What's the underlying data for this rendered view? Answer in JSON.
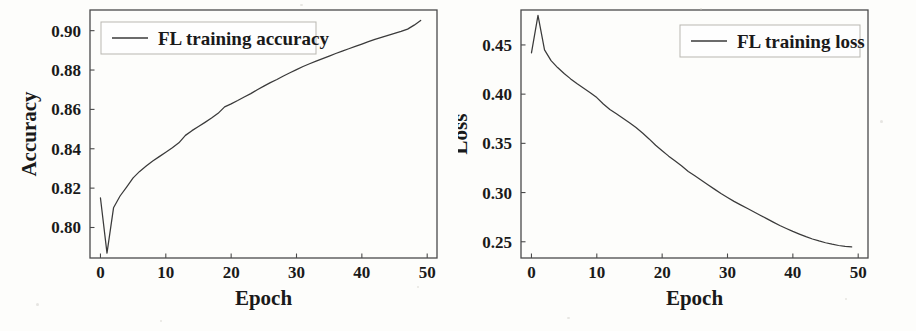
{
  "figure": {
    "background_color": "#fdfdfb",
    "line_color": "#3a3a3a",
    "text_color": "#1a1a1a",
    "axis_color": "#4a4a4a"
  },
  "charts": [
    {
      "id": "accuracy",
      "legend_label": "FL training accuracy",
      "xlabel": "Epoch",
      "ylabel": "Accuracy",
      "xticks": [
        "0",
        "10",
        "20",
        "30",
        "40",
        "50"
      ],
      "yticks": [
        "0.80",
        "0.82",
        "0.84",
        "0.86",
        "0.88",
        "0.90"
      ]
    },
    {
      "id": "loss",
      "legend_label": "FL training loss",
      "xlabel": "Epoch",
      "ylabel": "Loss",
      "xticks": [
        "0",
        "10",
        "20",
        "30",
        "40",
        "50"
      ],
      "yticks": [
        "0.25",
        "0.30",
        "0.35",
        "0.40",
        "0.45"
      ]
    }
  ],
  "chart_data": [
    {
      "type": "line",
      "title": "",
      "xlabel": "Epoch",
      "ylabel": "Accuracy",
      "xlim": [
        -1.6,
        51.5
      ],
      "ylim": [
        0.7845,
        0.9105
      ],
      "xticks": [
        0,
        10,
        20,
        30,
        40,
        50
      ],
      "yticks": [
        0.8,
        0.82,
        0.84,
        0.86,
        0.88,
        0.9
      ],
      "grid": false,
      "legend": [
        "FL training accuracy"
      ],
      "legend_position": "upper left",
      "series": [
        {
          "name": "FL training accuracy",
          "x": [
            0,
            1,
            2,
            3,
            4,
            5,
            6,
            7,
            8,
            9,
            10,
            11,
            12,
            13,
            14,
            15,
            16,
            17,
            18,
            19,
            20,
            21,
            22,
            23,
            24,
            25,
            26,
            27,
            28,
            29,
            30,
            31,
            32,
            33,
            34,
            35,
            36,
            37,
            38,
            39,
            40,
            41,
            42,
            43,
            44,
            45,
            46,
            47,
            48,
            49
          ],
          "values": [
            0.815,
            0.787,
            0.81,
            0.816,
            0.8205,
            0.8252,
            0.8285,
            0.8312,
            0.8338,
            0.836,
            0.8382,
            0.8405,
            0.843,
            0.8468,
            0.8492,
            0.8513,
            0.8534,
            0.8556,
            0.858,
            0.8613,
            0.8628,
            0.8645,
            0.8663,
            0.868,
            0.87,
            0.8718,
            0.8736,
            0.8752,
            0.877,
            0.8786,
            0.8802,
            0.8818,
            0.8832,
            0.8845,
            0.8858,
            0.8871,
            0.8884,
            0.8896,
            0.8908,
            0.892,
            0.8932,
            0.8944,
            0.8956,
            0.8966,
            0.8976,
            0.8986,
            0.8996,
            0.9008,
            0.9028,
            0.9052
          ]
        }
      ]
    },
    {
      "type": "line",
      "title": "",
      "xlabel": "Epoch",
      "ylabel": "Loss",
      "xlim": [
        -1.6,
        51.5
      ],
      "ylim": [
        0.2335,
        0.4855
      ],
      "xticks": [
        0,
        10,
        20,
        30,
        40,
        50
      ],
      "yticks": [
        0.25,
        0.3,
        0.35,
        0.4,
        0.45
      ],
      "grid": false,
      "legend": [
        "FL training loss"
      ],
      "legend_position": "upper right",
      "series": [
        {
          "name": "FL training loss",
          "x": [
            0,
            1,
            2,
            3,
            4,
            5,
            6,
            7,
            8,
            9,
            10,
            11,
            12,
            13,
            14,
            15,
            16,
            17,
            18,
            19,
            20,
            21,
            22,
            23,
            24,
            25,
            26,
            27,
            28,
            29,
            30,
            31,
            32,
            33,
            34,
            35,
            36,
            37,
            38,
            39,
            40,
            41,
            42,
            43,
            44,
            45,
            46,
            47,
            48,
            49
          ],
          "values": [
            0.442,
            0.48,
            0.445,
            0.434,
            0.427,
            0.421,
            0.4155,
            0.4105,
            0.406,
            0.4015,
            0.3965,
            0.39,
            0.3845,
            0.38,
            0.3755,
            0.371,
            0.366,
            0.3605,
            0.3545,
            0.348,
            0.3425,
            0.337,
            0.332,
            0.327,
            0.3215,
            0.317,
            0.3125,
            0.308,
            0.3035,
            0.299,
            0.295,
            0.291,
            0.2875,
            0.284,
            0.2805,
            0.277,
            0.2735,
            0.27,
            0.2665,
            0.2635,
            0.2605,
            0.2578,
            0.2552,
            0.2528,
            0.2508,
            0.249,
            0.2475,
            0.2462,
            0.2452,
            0.2448
          ]
        }
      ]
    }
  ]
}
